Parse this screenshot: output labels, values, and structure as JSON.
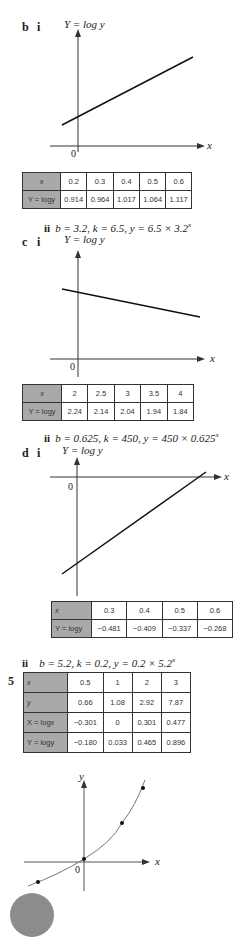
{
  "part_b": {
    "label": "b",
    "sub_i": "i",
    "y_axis_label": "Y = log y",
    "x_axis_label": "x",
    "origin_label": "0",
    "table": {
      "row_headers": [
        "x",
        "Y = logy"
      ],
      "x": [
        "0.2",
        "0.3",
        "0.4",
        "0.5",
        "0.6"
      ],
      "Y": [
        "0.914",
        "0.964",
        "1.017",
        "1.064",
        "1.117"
      ]
    },
    "sub_ii": "ii",
    "answer_text": "b = 3.2, k = 6.5, y = 6.5 × 3.2",
    "answer_exponent": "x"
  },
  "part_c": {
    "label": "c",
    "sub_i": "i",
    "y_axis_label": "Y = log y",
    "x_axis_label": "x",
    "origin_label": "0",
    "table": {
      "row_headers": [
        "x",
        "Y = logy"
      ],
      "x": [
        "2",
        "2.5",
        "3",
        "3.5",
        "4"
      ],
      "Y": [
        "2.24",
        "2.14",
        "2.04",
        "1.94",
        "1.84"
      ]
    },
    "sub_ii": "ii",
    "answer_text": "b = 0.625, k = 450, y = 450 × 0.625",
    "answer_exponent": "x"
  },
  "part_d": {
    "label": "d",
    "sub_i": "i",
    "y_axis_label": "Y = log y",
    "x_axis_label": "x",
    "origin_label": "0",
    "table": {
      "row_headers": [
        "x",
        "Y = logy"
      ],
      "x": [
        "0.3",
        "0.4",
        "0.5",
        "0.6"
      ],
      "Y": [
        "−0.481",
        "−0.409",
        "−0.337",
        "−0.268"
      ]
    },
    "sub_ii": "ii",
    "answer_text": "b = 5.2, k = 0.2, y = 0.2 × 5.2",
    "answer_exponent": "x"
  },
  "question_5": {
    "label": "5",
    "table": {
      "row_headers": [
        "x",
        "y",
        "X = logx",
        "Y = logy"
      ],
      "rows": [
        [
          "0.5",
          "1",
          "2",
          "3"
        ],
        [
          "0.66",
          "1.08",
          "2.92",
          "7.87"
        ],
        [
          "−0.301",
          "0",
          "0.301",
          "0.477"
        ],
        [
          "−0.180",
          "0.033",
          "0.465",
          "0.896"
        ]
      ]
    },
    "graph": {
      "y_axis_label": "y",
      "x_axis_label": "x",
      "origin_label": "0"
    }
  },
  "colors": {
    "header_cell": "#a9a9a9",
    "line": "#222222",
    "curve": "#666666",
    "page_badge": "#8c8c8c"
  }
}
